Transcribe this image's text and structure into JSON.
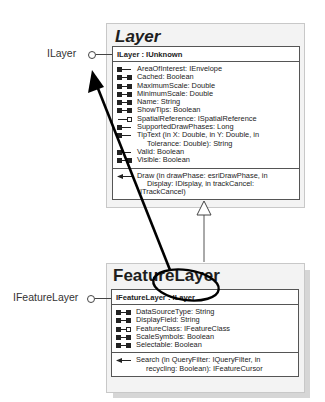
{
  "layer": {
    "class_name": "Layer",
    "external_interface": "ILayer",
    "interface_header": "ILayer : IUnknown",
    "properties": [
      {
        "icon": "get",
        "text": "AreaOfInterest: IEnvelope"
      },
      {
        "icon": "get-put",
        "text": "Cached: Boolean"
      },
      {
        "icon": "get-put",
        "text": "MaximumScale: Double"
      },
      {
        "icon": "get-put",
        "text": "MinimumScale: Double"
      },
      {
        "icon": "get-put",
        "text": "Name: String"
      },
      {
        "icon": "get-put",
        "text": "ShowTips: Boolean"
      },
      {
        "icon": "put-ref",
        "text": "SpatialReference: ISpatialReference"
      },
      {
        "icon": "get",
        "text": "SupportedDrawPhases: Long"
      },
      {
        "icon": "get",
        "text": "TipText (in X: Double, in Y: Double, in",
        "cont": "Tolerance: Double): String"
      },
      {
        "icon": "get",
        "text": "Valid: Boolean"
      },
      {
        "icon": "get-put",
        "text": "Visible: Boolean"
      }
    ],
    "methods": [
      {
        "icon": "method",
        "text": "Draw (in drawPhase: esriDrawPhase, in",
        "cont": "Display: IDisplay, in trackCancel:",
        "cont2": "ITrackCancel)"
      }
    ]
  },
  "feature_layer": {
    "class_name": "FeatureLayer",
    "external_interface": "IFeatureLayer",
    "interface_header": "IFeatureLayer : ILayer",
    "properties": [
      {
        "icon": "get-put",
        "text": "DataSourceType: String"
      },
      {
        "icon": "get-put",
        "text": "DisplayField: String"
      },
      {
        "icon": "get-put-ref",
        "text": "FeatureClass: IFeatureClass"
      },
      {
        "icon": "get-put",
        "text": "ScaleSymbols: Boolean"
      },
      {
        "icon": "get-put",
        "text": "Selectable: Boolean"
      }
    ],
    "methods": [
      {
        "icon": "method",
        "text": "Search (in QueryFilter: IQueryFilter, in",
        "cont": "recycling: Boolean): IFeatureCursor"
      }
    ]
  },
  "relationships": [
    {
      "type": "inheritance",
      "from": "FeatureLayer",
      "to": "Layer"
    },
    {
      "type": "annotation-arrow",
      "from": "ILayer (in IFeatureLayer : ILayer)",
      "to": "ILayer"
    }
  ],
  "colors": {
    "line": "#444444",
    "annotation": "#000000",
    "box_fill": "#f3f3f3"
  }
}
